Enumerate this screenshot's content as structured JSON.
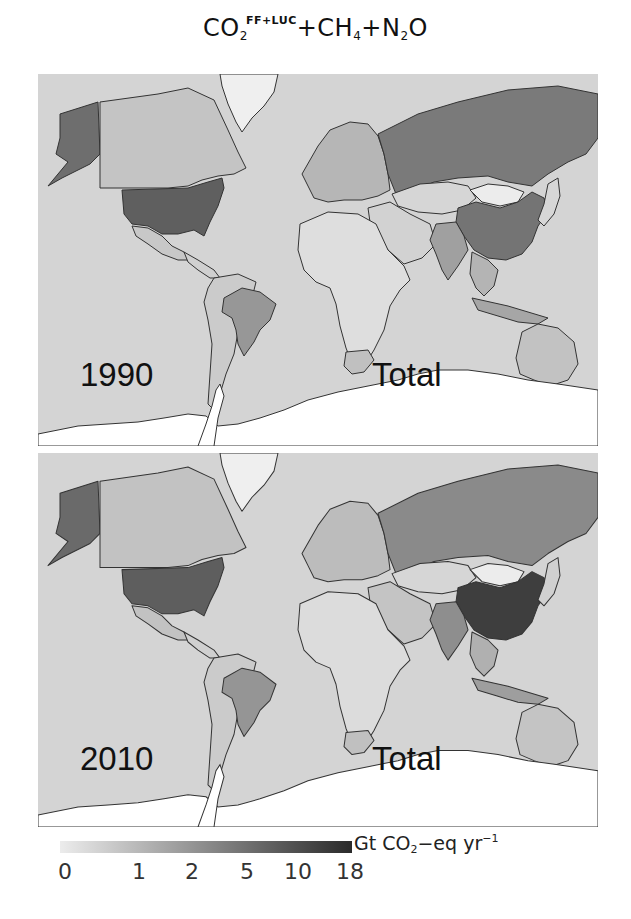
{
  "title": {
    "gas1": "CO",
    "gas1_sub": "2",
    "gas1_sup": "FF+LUC",
    "plus1": "+CH",
    "gas2_sub": "4",
    "plus2": "+N",
    "gas3_sub": "2",
    "gas3_tail": "O"
  },
  "panels": [
    {
      "year": "1990",
      "label": "Total",
      "shades": {
        "ocean": "#d4d4d4",
        "alaska": "#6e6e6e",
        "canada": "#c4c4c4",
        "usa": "#5f5f5f",
        "mexico": "#c8c8c8",
        "central_america": "#d0d0d0",
        "south_america_other": "#cbcbcb",
        "brazil": "#979797",
        "greenland": "#efefef",
        "europe": "#b6b6b6",
        "russia": "#7a7a7a",
        "africa": "#dedede",
        "south_africa": "#c0c0c0",
        "middle_east": "#d2d2d2",
        "central_asia": "#d6d6d6",
        "mongolia": "#ececec",
        "china": "#747474",
        "india": "#a0a0a0",
        "southeast_asia": "#b4b4b4",
        "indonesia": "#a6a6a6",
        "japan": "#d6d6d6",
        "australia": "#c2c2c2",
        "new_zealand": "#d2d2d2",
        "antarctica": "#ffffff"
      }
    },
    {
      "year": "2010",
      "label": "Total",
      "shades": {
        "ocean": "#d4d4d4",
        "alaska": "#6a6a6a",
        "canada": "#c2c2c2",
        "usa": "#5e5e5e",
        "mexico": "#c2c2c2",
        "central_america": "#d0d0d0",
        "south_america_other": "#cbcbcb",
        "brazil": "#959595",
        "greenland": "#efefef",
        "europe": "#bcbcbc",
        "russia": "#8a8a8a",
        "africa": "#dcdcdc",
        "south_africa": "#c0c0c0",
        "middle_east": "#c4c4c4",
        "central_asia": "#d6d6d6",
        "mongolia": "#ececec",
        "china": "#3e3e3e",
        "india": "#8e8e8e",
        "southeast_asia": "#b0b0b0",
        "indonesia": "#9e9e9e",
        "japan": "#d0d0d0",
        "australia": "#c4c4c4",
        "new_zealand": "#d2d2d2",
        "antarctica": "#ffffff"
      }
    }
  ],
  "colorbar": {
    "unit_main": "Gt CO",
    "unit_sub": "2",
    "unit_rest": "−eq yr",
    "unit_sup": "−1",
    "color_low": "#ececec",
    "color_high": "#2a2a2a",
    "ticks": [
      "0",
      "1",
      "2",
      "5",
      "10",
      "18"
    ]
  },
  "chart_data": {
    "type": "heatmap",
    "subtype": "choropleth_map",
    "panels": [
      "1990 Total",
      "2010 Total"
    ],
    "colorbar_label": "Gt CO2-eq yr^-1",
    "colorbar_ticks": [
      0,
      1,
      2,
      5,
      10,
      18
    ],
    "colorbar_range": [
      0,
      18
    ],
    "scale": "nonlinear",
    "approx_values": {
      "1990": {
        "USA": 6.0,
        "China": 4.0,
        "Russia": 3.5,
        "Brazil": 2.0,
        "India": 1.5,
        "Canada": 0.7,
        "Australia": 0.6,
        "Indonesia": 1.2,
        "Mongolia": 0.05
      },
      "2010": {
        "USA": 6.5,
        "China": 11.0,
        "Russia": 2.5,
        "Brazil": 2.0,
        "India": 2.5,
        "Canada": 0.8,
        "Australia": 0.6,
        "Indonesia": 1.5,
        "Mongolia": 0.05
      }
    }
  }
}
